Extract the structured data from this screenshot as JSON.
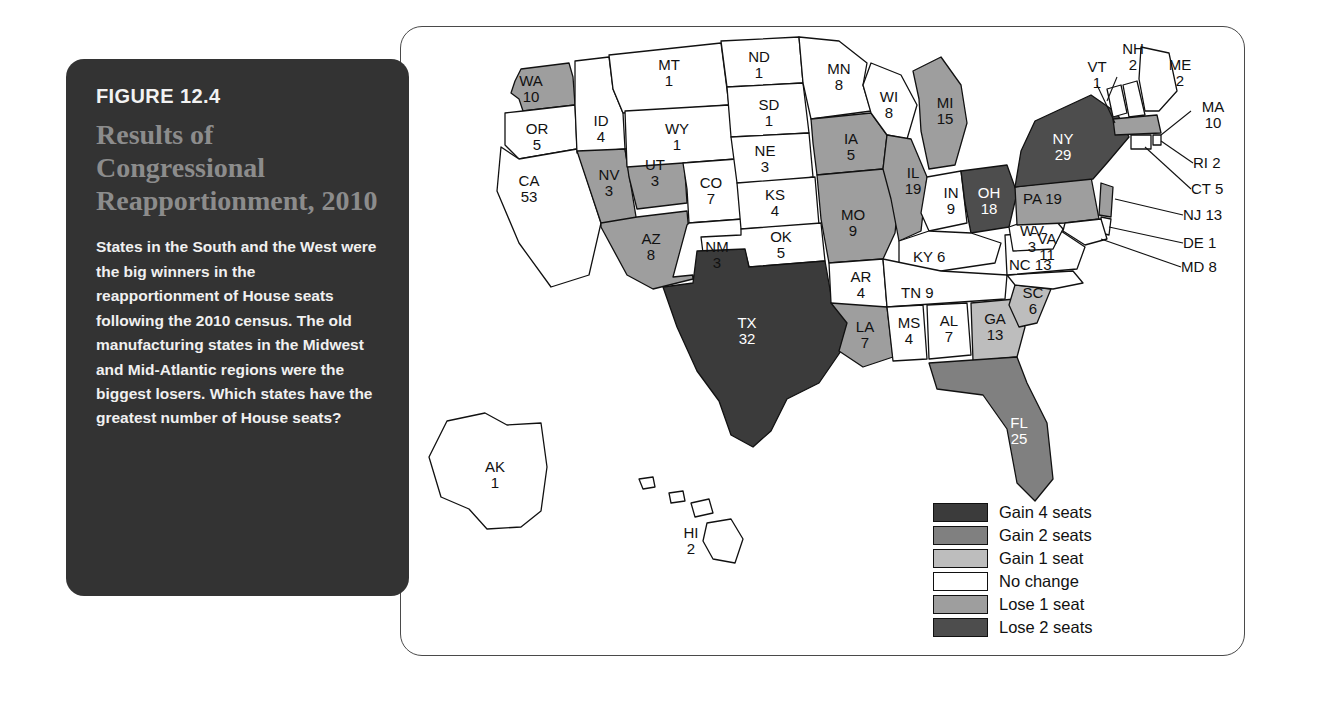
{
  "figure": {
    "number": "FIGURE 12.4",
    "title": "Results of Congressional Reapportionment, 2010",
    "body": "States in the South and the West were the big winners in the reapportionment of House seats following the 2010 census. The old manufacturing states in the Midwest and Mid-Atlantic regions were the biggest losers. Which states have the greatest number of House seats?"
  },
  "colors": {
    "gain4": "#3b3b3b",
    "gain2": "#808080",
    "gain1": "#bdbdbd",
    "nochange": "#ffffff",
    "lose1": "#9e9e9e",
    "lose2": "#4d4d4d",
    "stroke": "#111111",
    "panel_bg": "#333333",
    "title_gray": "#8c8c8c"
  },
  "legend": {
    "items": [
      {
        "label": "Gain 4 seats",
        "color": "#3b3b3b"
      },
      {
        "label": "Gain 2 seats",
        "color": "#808080"
      },
      {
        "label": "Gain 1 seat",
        "color": "#bdbdbd"
      },
      {
        "label": "No change",
        "color": "#ffffff"
      },
      {
        "label": "Lose 1 seat",
        "color": "#9e9e9e"
      },
      {
        "label": "Lose 2 seats",
        "color": "#4d4d4d"
      }
    ]
  },
  "chart_data": {
    "type": "map",
    "title": "Results of Congressional Reapportionment, 2010",
    "value_label": "House seats",
    "category_label": "Reapportionment change",
    "legend_position": "bottom-right",
    "states": [
      {
        "abbr": "WA",
        "seats": "10",
        "change": "Gain 1 seat",
        "fill": "#9e9e9e"
      },
      {
        "abbr": "OR",
        "seats": "5",
        "change": "No change",
        "fill": "#ffffff"
      },
      {
        "abbr": "CA",
        "seats": "53",
        "change": "No change",
        "fill": "#ffffff"
      },
      {
        "abbr": "ID",
        "seats": "4",
        "change": "No change",
        "fill": "#ffffff"
      },
      {
        "abbr": "NV",
        "seats": "3",
        "change": "Gain 1 seat",
        "fill": "#9e9e9e"
      },
      {
        "abbr": "UT",
        "seats": "3",
        "change": "Gain 1 seat",
        "fill": "#9e9e9e"
      },
      {
        "abbr": "AZ",
        "seats": "8",
        "change": "Gain 1 seat",
        "fill": "#9e9e9e"
      },
      {
        "abbr": "MT",
        "seats": "1",
        "change": "No change",
        "fill": "#ffffff"
      },
      {
        "abbr": "WY",
        "seats": "1",
        "change": "No change",
        "fill": "#ffffff"
      },
      {
        "abbr": "CO",
        "seats": "7",
        "change": "No change",
        "fill": "#ffffff"
      },
      {
        "abbr": "NM",
        "seats": "3",
        "change": "No change",
        "fill": "#ffffff"
      },
      {
        "abbr": "ND",
        "seats": "1",
        "change": "No change",
        "fill": "#ffffff"
      },
      {
        "abbr": "SD",
        "seats": "1",
        "change": "No change",
        "fill": "#ffffff"
      },
      {
        "abbr": "NE",
        "seats": "3",
        "change": "No change",
        "fill": "#ffffff"
      },
      {
        "abbr": "KS",
        "seats": "4",
        "change": "No change",
        "fill": "#ffffff"
      },
      {
        "abbr": "OK",
        "seats": "5",
        "change": "No change",
        "fill": "#ffffff"
      },
      {
        "abbr": "TX",
        "seats": "32",
        "change": "Gain 4 seats",
        "fill": "#3b3b3b"
      },
      {
        "abbr": "MN",
        "seats": "8",
        "change": "No change",
        "fill": "#ffffff"
      },
      {
        "abbr": "IA",
        "seats": "5",
        "change": "Lose 1 seat",
        "fill": "#9e9e9e"
      },
      {
        "abbr": "MO",
        "seats": "9",
        "change": "Lose 1 seat",
        "fill": "#9e9e9e"
      },
      {
        "abbr": "AR",
        "seats": "4",
        "change": "No change",
        "fill": "#ffffff"
      },
      {
        "abbr": "LA",
        "seats": "7",
        "change": "Lose 1 seat",
        "fill": "#9e9e9e"
      },
      {
        "abbr": "WI",
        "seats": "8",
        "change": "No change",
        "fill": "#ffffff"
      },
      {
        "abbr": "IL",
        "seats": "19",
        "change": "Lose 1 seat",
        "fill": "#9e9e9e"
      },
      {
        "abbr": "MI",
        "seats": "15",
        "change": "Lose 1 seat",
        "fill": "#9e9e9e"
      },
      {
        "abbr": "IN",
        "seats": "9",
        "change": "No change",
        "fill": "#ffffff"
      },
      {
        "abbr": "OH",
        "seats": "18",
        "change": "Lose 2 seats",
        "fill": "#4d4d4d"
      },
      {
        "abbr": "KY",
        "seats": "6",
        "change": "No change",
        "fill": "#ffffff"
      },
      {
        "abbr": "TN",
        "seats": "9",
        "change": "No change",
        "fill": "#ffffff"
      },
      {
        "abbr": "MS",
        "seats": "4",
        "change": "No change",
        "fill": "#ffffff"
      },
      {
        "abbr": "AL",
        "seats": "7",
        "change": "No change",
        "fill": "#ffffff"
      },
      {
        "abbr": "GA",
        "seats": "13",
        "change": "Gain 1 seat",
        "fill": "#bdbdbd"
      },
      {
        "abbr": "SC",
        "seats": "6",
        "change": "Gain 1 seat",
        "fill": "#bdbdbd"
      },
      {
        "abbr": "FL",
        "seats": "25",
        "change": "Gain 2 seats",
        "fill": "#808080"
      },
      {
        "abbr": "NC",
        "seats": "13",
        "change": "No change",
        "fill": "#ffffff"
      },
      {
        "abbr": "VA",
        "seats": "11",
        "change": "No change",
        "fill": "#ffffff"
      },
      {
        "abbr": "WV",
        "seats": "3",
        "change": "No change",
        "fill": "#ffffff"
      },
      {
        "abbr": "PA",
        "seats": "19",
        "change": "Lose 1 seat",
        "fill": "#9e9e9e"
      },
      {
        "abbr": "NY",
        "seats": "29",
        "change": "Lose 2 seats",
        "fill": "#4d4d4d"
      },
      {
        "abbr": "VT",
        "seats": "1",
        "change": "No change",
        "fill": "#ffffff"
      },
      {
        "abbr": "NH",
        "seats": "2",
        "change": "No change",
        "fill": "#ffffff"
      },
      {
        "abbr": "ME",
        "seats": "2",
        "change": "No change",
        "fill": "#ffffff"
      },
      {
        "abbr": "MA",
        "seats": "10",
        "change": "Lose 1 seat",
        "fill": "#9e9e9e"
      },
      {
        "abbr": "RI",
        "seats": "2",
        "change": "No change",
        "fill": "#ffffff"
      },
      {
        "abbr": "CT",
        "seats": "5",
        "change": "No change",
        "fill": "#ffffff"
      },
      {
        "abbr": "NJ",
        "seats": "13",
        "change": "Lose 1 seat",
        "fill": "#9e9e9e"
      },
      {
        "abbr": "DE",
        "seats": "1",
        "change": "No change",
        "fill": "#ffffff"
      },
      {
        "abbr": "MD",
        "seats": "8",
        "change": "No change",
        "fill": "#ffffff"
      },
      {
        "abbr": "AK",
        "seats": "1",
        "change": "No change",
        "fill": "#ffffff"
      },
      {
        "abbr": "HI",
        "seats": "2",
        "change": "No change",
        "fill": "#ffffff"
      }
    ]
  },
  "labels": {
    "WA": "WA\n10",
    "OR": "OR\n5",
    "CA": "CA\n53",
    "ID": "ID\n4",
    "NV": "NV\n3",
    "UT": "UT\n3",
    "AZ": "AZ\n8",
    "MT": "MT\n1",
    "WY": "WY\n1",
    "CO": "CO\n7",
    "NM": "NM\n3",
    "ND": "ND\n1",
    "SD": "SD\n1",
    "NE": "NE\n3",
    "KS": "KS\n4",
    "OK": "OK\n5",
    "TX": "TX\n32",
    "MN": "MN\n8",
    "IA": "IA\n5",
    "MO": "MO\n9",
    "AR": "AR\n4",
    "LA": "LA\n7",
    "WI": "WI\n8",
    "IL": "IL\n19",
    "MI": "MI\n15",
    "IN": "IN\n9",
    "OH": "OH\n18",
    "KY": "KY 6",
    "TN": "TN 9",
    "MS": "MS\n4",
    "AL": "AL\n7",
    "GA": "GA\n13",
    "SC": "SC\n6",
    "FL": "FL\n25",
    "NC": "NC 13",
    "VA": "VA\n11",
    "WV": "W̵V̵\n3",
    "PA": "PA 19",
    "NY": "NY\n29",
    "VT": "VT\n1",
    "NH": "NH\n2",
    "ME": "ME\n2",
    "MA": "MA\n10",
    "RI": "RI 2",
    "CT": "CT 5",
    "NJ": "NJ 13",
    "DE": "DE 1",
    "MD": "MD 8",
    "AK": "AK\n1",
    "HI": "HI\n2"
  }
}
